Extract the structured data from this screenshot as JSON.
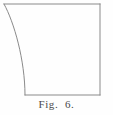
{
  "figure": {
    "caption": "Fig.  6.",
    "caption_plain": "Fig. 6.",
    "label_prefix": "Fig.",
    "number": "6.",
    "background_color": "#fefefe",
    "line_color": "#8a8a8a",
    "caption_color": "#4a4a4a",
    "line_width": 1,
    "geometry": {
      "top_edge": "M 4 4 L 100 4",
      "right_edge": "M 100 4 L 100 95",
      "bottom_edge": "M 100 95 L 25 95",
      "curved_left_edge": "M 25 95 C 25 60 14 22 4 4",
      "corners": {
        "top_left": "4,4",
        "top_right": "100,4",
        "bottom_right": "100,95",
        "bottom_left": "25,95"
      }
    }
  }
}
